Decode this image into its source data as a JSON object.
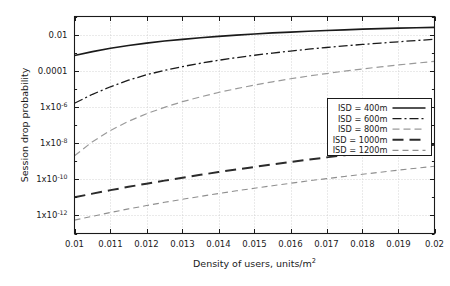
{
  "chart_data": {
    "type": "line",
    "title": "",
    "xlabel": "Density of users, units/m2",
    "xlabel_base": "Density of users, units/m",
    "xlabel_exp": "2",
    "ylabel": "Session drop probability",
    "xscale": "linear",
    "yscale": "log",
    "xlim": [
      0.01,
      0.02
    ],
    "ylim": [
      1e-13,
      0.1
    ],
    "grid": true,
    "legend_position": "right-middle",
    "xticks": [
      "0.01",
      "0.011",
      "0.012",
      "0.013",
      "0.014",
      "0.015",
      "0.016",
      "0.017",
      "0.018",
      "0.019",
      "0.02"
    ],
    "xtick_values": [
      0.01,
      0.011,
      0.012,
      0.013,
      0.014,
      0.015,
      0.016,
      0.017,
      0.018,
      0.019,
      0.02
    ],
    "yticks": [
      {
        "value": 0.01,
        "base": "0.01",
        "exp": ""
      },
      {
        "value": 0.0001,
        "base": "0.0001",
        "exp": ""
      },
      {
        "value": 1e-06,
        "base": "1x10",
        "exp": "-6"
      },
      {
        "value": 1e-08,
        "base": "1x10",
        "exp": "-8"
      },
      {
        "value": 1e-10,
        "base": "1x10",
        "exp": "-10"
      },
      {
        "value": 1e-12,
        "base": "1x10",
        "exp": "-12"
      }
    ],
    "x": [
      0.01,
      0.0105,
      0.011,
      0.0115,
      0.012,
      0.0125,
      0.013,
      0.0135,
      0.014,
      0.0145,
      0.015,
      0.0155,
      0.016,
      0.0165,
      0.017,
      0.0175,
      0.018,
      0.0185,
      0.019,
      0.0195,
      0.02
    ],
    "series": [
      {
        "name": "ISD = 400m",
        "label": "ISD = 400m",
        "style": "solid-thick",
        "color": "#1a1a1a",
        "width": 1.7,
        "dash": "",
        "values": [
          0.0007,
          0.00115,
          0.00175,
          0.0025,
          0.0034,
          0.0044,
          0.0055,
          0.0067,
          0.008,
          0.0094,
          0.0108,
          0.0123,
          0.0138,
          0.0153,
          0.0168,
          0.0183,
          0.0198,
          0.0212,
          0.0226,
          0.0239,
          0.025
        ]
      },
      {
        "name": "ISD = 600m",
        "label": "ISD = 600m",
        "style": "dash-dot",
        "color": "#1a1a1a",
        "width": 1.3,
        "dash": "9,3,2,3",
        "values": [
          1.6e-06,
          5e-06,
          1.3e-05,
          3e-05,
          6e-05,
          0.000105,
          0.00017,
          0.00026,
          0.00038,
          0.00053,
          0.00072,
          0.00095,
          0.00122,
          0.00155,
          0.00193,
          0.00236,
          0.00285,
          0.0034,
          0.004,
          0.0047,
          0.0055
        ]
      },
      {
        "name": "ISD = 800m",
        "label": "ISD = 800m",
        "style": "dashed-light",
        "color": "#9a9a9a",
        "width": 1.2,
        "dash": "7,4",
        "values": [
          2e-09,
          1.2e-08,
          5e-08,
          1.6e-07,
          4.2e-07,
          9.5e-07,
          1.95e-06,
          3.6e-06,
          6.3e-06,
          1.03e-05,
          1.62e-05,
          2.45e-05,
          3.6e-05,
          5.1e-05,
          7e-05,
          9.5e-05,
          0.000126,
          0.000164,
          0.00021,
          0.000265,
          0.00033
        ]
      },
      {
        "name": "ISD = 1000m",
        "label": "ISD = 1000m",
        "style": "dashed-thick",
        "color": "#2b2b2b",
        "width": 2.0,
        "dash": "11,6",
        "values": [
          1e-11,
          1.6e-11,
          2.5e-11,
          3.8e-11,
          5.7e-11,
          8.4e-11,
          1.22e-10,
          1.75e-10,
          2.5e-10,
          3.5e-10,
          4.8e-10,
          6.6e-10,
          9e-10,
          1.22e-09,
          1.62e-09,
          2.15e-09,
          2.8e-09,
          3.7e-09,
          4.8e-09,
          6.2e-09,
          8e-09
        ]
      },
      {
        "name": "ISD = 1200m",
        "label": "ISD = 1200m",
        "style": "dashed-thin-light",
        "color": "#8f8f8f",
        "width": 1.1,
        "dash": "6,4",
        "values": [
          5.5e-13,
          9e-13,
          1.45e-12,
          2.3e-12,
          3.5e-12,
          5.3e-12,
          7.8e-12,
          1.13e-11,
          1.62e-11,
          2.3e-11,
          3.2e-11,
          4.4e-11,
          6e-11,
          8.1e-11,
          1.08e-10,
          1.43e-10,
          1.88e-10,
          2.45e-10,
          3.2e-10,
          4.1e-10,
          5.2e-10
        ]
      }
    ]
  },
  "colors": {
    "frame": "#1a1a1a",
    "grid": "#c9c9c9",
    "background": "#ffffff",
    "legend_border": "#1a1a1a"
  }
}
